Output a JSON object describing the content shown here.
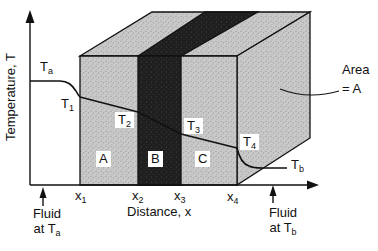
{
  "figure": {
    "type": "diagram"
  },
  "colors": {
    "background": "#ffffff",
    "face_light": "#c9c9c9",
    "face_light_dot": "#8a8a8a",
    "face_dark": "#1f1f1f",
    "face_dark_dot": "#4f4f4f",
    "line": "#111111"
  },
  "axes": {
    "y_label": "Temperature, T",
    "x_label": "Distance, x"
  },
  "temperatures": {
    "ta": {
      "base": "T",
      "sub": "a"
    },
    "t1": {
      "base": "T",
      "sub": "1"
    },
    "t2": {
      "base": "T",
      "sub": "2"
    },
    "t3": {
      "base": "T",
      "sub": "3"
    },
    "t4": {
      "base": "T",
      "sub": "4"
    },
    "tb": {
      "base": "T",
      "sub": "b"
    }
  },
  "x_ticks": {
    "x1": {
      "base": "x",
      "sub": "1"
    },
    "x2": {
      "base": "x",
      "sub": "2"
    },
    "x3": {
      "base": "x",
      "sub": "3"
    },
    "x4": {
      "base": "x",
      "sub": "4"
    }
  },
  "layers": {
    "a": "A",
    "b": "B",
    "c": "C"
  },
  "annotations": {
    "area": {
      "line1": "Area",
      "line2": "= A"
    },
    "fluid_a": {
      "line1": "Fluid",
      "line2_base": "at T",
      "line2_sub": "a"
    },
    "fluid_b": {
      "line1": "Fluid",
      "line2_base": "at T",
      "line2_sub": "b"
    }
  }
}
